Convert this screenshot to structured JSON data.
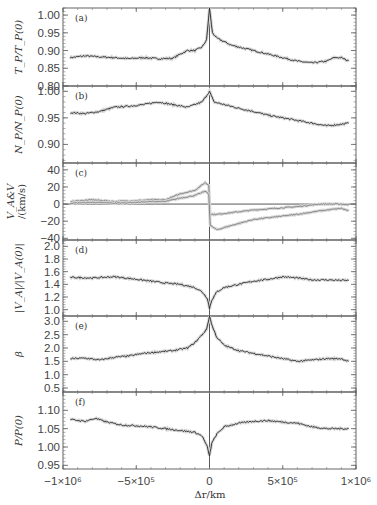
{
  "chart_data": {
    "type": "line",
    "layout": "6 vertically stacked panels sharing x-axis",
    "xlabel": "Δr/km",
    "xlim": [
      -1000000,
      1000000
    ],
    "x_ticks": [
      -1000000,
      -500000,
      0,
      500000,
      1000000
    ],
    "x_tick_labels": [
      "−1×10⁶",
      "−5×10⁵",
      "0",
      "5×10⁵",
      "1×10⁶"
    ],
    "vertical_reference_line_x": 0,
    "panels": [
      {
        "tag": "(a)",
        "ylabel": "T_P/T_P(0)",
        "ylim": [
          0.8,
          1.02
        ],
        "y_ticks": [
          0.8,
          0.85,
          0.9,
          0.95,
          1.0
        ],
        "y_tick_labels": [
          "0.80",
          "0.85",
          "0.90",
          "0.95",
          "1.00"
        ],
        "series": [
          {
            "name": "T_P/T_P(0)",
            "x": [
              -950000,
              -850000,
              -750000,
              -650000,
              -550000,
              -450000,
              -350000,
              -250000,
              -200000,
              -150000,
              -100000,
              -50000,
              -20000,
              0,
              20000,
              50000,
              100000,
              150000,
              200000,
              250000,
              300000,
              400000,
              500000,
              600000,
              700000,
              800000,
              850000,
              900000,
              950000
            ],
            "y": [
              0.88,
              0.885,
              0.882,
              0.88,
              0.877,
              0.88,
              0.877,
              0.878,
              0.89,
              0.9,
              0.9,
              0.91,
              0.93,
              1.02,
              0.95,
              0.935,
              0.925,
              0.915,
              0.91,
              0.905,
              0.9,
              0.89,
              0.88,
              0.87,
              0.865,
              0.87,
              0.88,
              0.88,
              0.87
            ]
          }
        ]
      },
      {
        "tag": "(b)",
        "ylabel": "N_P/N_P(0)",
        "ylim": [
          0.865,
          1.01
        ],
        "y_ticks": [
          0.9,
          0.95,
          1.0
        ],
        "y_tick_labels": [
          "0.90",
          "0.95",
          "1.00"
        ],
        "series": [
          {
            "name": "N_P/N_P(0)",
            "x": [
              -950000,
              -850000,
              -750000,
              -650000,
              -550000,
              -450000,
              -350000,
              -250000,
              -150000,
              -100000,
              -50000,
              0,
              30000,
              100000,
              200000,
              300000,
              400000,
              500000,
              600000,
              700000,
              800000,
              900000,
              950000
            ],
            "y": [
              0.96,
              0.958,
              0.962,
              0.97,
              0.972,
              0.975,
              0.98,
              0.975,
              0.97,
              0.975,
              0.98,
              1.0,
              0.98,
              0.975,
              0.968,
              0.962,
              0.955,
              0.95,
              0.945,
              0.94,
              0.935,
              0.938,
              0.94
            ]
          }
        ]
      },
      {
        "tag": "(c)",
        "ylabel": "V_A&V",
        "ylabel2": "/(km/s)",
        "ylim": [
          -42,
          48
        ],
        "y_ticks": [
          -40,
          -20,
          0,
          20,
          40
        ],
        "y_tick_labels": [
          "−40",
          "−20",
          "0",
          "20",
          "40"
        ],
        "horizontal_reference_line_y": 0,
        "series": [
          {
            "name": "V_A (upper gray)",
            "x": [
              -950000,
              -800000,
              -650000,
              -500000,
              -400000,
              -300000,
              -200000,
              -100000,
              -30000,
              -5000,
              5000,
              50000,
              150000,
              300000,
              450000,
              600000,
              750000,
              900000,
              950000
            ],
            "y": [
              3,
              5,
              3,
              4,
              5,
              5,
              12,
              16,
              25,
              22,
              -12,
              -12,
              -10,
              -7,
              -5,
              -3,
              0,
              0,
              -1
            ]
          },
          {
            "name": "V (lower gray)",
            "x": [
              -950000,
              -800000,
              -650000,
              -500000,
              -400000,
              -300000,
              -200000,
              -100000,
              -30000,
              -5000,
              5000,
              50000,
              150000,
              300000,
              450000,
              600000,
              750000,
              900000,
              950000
            ],
            "y": [
              1,
              2,
              1,
              2,
              3,
              3,
              7,
              10,
              15,
              12,
              -25,
              -30,
              -25,
              -18,
              -15,
              -12,
              -8,
              -5,
              -8
            ]
          }
        ]
      },
      {
        "tag": "(d)",
        "ylabel": "|V_A|/|V_A(0)|",
        "ylim": [
          0.9,
          2.1
        ],
        "y_ticks": [
          1.0,
          1.2,
          1.4,
          1.6,
          1.8,
          2.0
        ],
        "y_tick_labels": [
          "1.0",
          "1.2",
          "1.4",
          "1.6",
          "1.8",
          "2.0"
        ],
        "series": [
          {
            "name": "|V_A|/|V_A(0)|",
            "x": [
              -950000,
              -800000,
              -650000,
              -500000,
              -400000,
              -300000,
              -200000,
              -100000,
              -50000,
              -15000,
              0,
              15000,
              50000,
              100000,
              200000,
              300000,
              400000,
              500000,
              600000,
              700000,
              800000,
              950000
            ],
            "y": [
              1.51,
              1.5,
              1.52,
              1.48,
              1.45,
              1.42,
              1.4,
              1.35,
              1.28,
              1.18,
              1.02,
              1.15,
              1.28,
              1.35,
              1.4,
              1.45,
              1.48,
              1.52,
              1.5,
              1.47,
              1.47,
              1.46
            ]
          }
        ]
      },
      {
        "tag": "(e)",
        "ylabel": "β",
        "ylim": [
          0.35,
          3.2
        ],
        "y_ticks": [
          0.5,
          1.0,
          1.5,
          2.0,
          2.5,
          3.0
        ],
        "y_tick_labels": [
          "0.5",
          "1.0",
          "1.5",
          "2.0",
          "2.5",
          "3.0"
        ],
        "series": [
          {
            "name": "β",
            "x": [
              -950000,
              -850000,
              -750000,
              -650000,
              -550000,
              -450000,
              -350000,
              -250000,
              -150000,
              -100000,
              -50000,
              -20000,
              0,
              20000,
              50000,
              100000,
              200000,
              300000,
              400000,
              500000,
              600000,
              700000,
              800000,
              900000,
              950000
            ],
            "y": [
              1.6,
              1.62,
              1.55,
              1.65,
              1.7,
              1.8,
              1.85,
              1.9,
              2.0,
              2.2,
              2.5,
              2.7,
              3.2,
              2.8,
              2.4,
              2.1,
              1.9,
              1.8,
              1.7,
              1.6,
              1.5,
              1.55,
              1.6,
              1.6,
              1.5
            ]
          }
        ]
      },
      {
        "tag": "(f)",
        "ylabel": "P/P(0)",
        "ylim": [
          0.94,
          1.15
        ],
        "y_ticks": [
          0.95,
          1.0,
          1.05,
          1.1
        ],
        "y_tick_labels": [
          "0.95",
          "1.00",
          "1.05",
          "1.10"
        ],
        "series": [
          {
            "name": "P/P(0)",
            "x": [
              -950000,
              -850000,
              -780000,
              -700000,
              -600000,
              -500000,
              -400000,
              -300000,
              -200000,
              -100000,
              -50000,
              -15000,
              0,
              15000,
              50000,
              100000,
              200000,
              300000,
              400000,
              500000,
              600000,
              700000,
              800000,
              900000,
              950000
            ],
            "y": [
              1.075,
              1.07,
              1.078,
              1.068,
              1.06,
              1.058,
              1.055,
              1.05,
              1.045,
              1.04,
              1.03,
              1.0,
              0.975,
              1.01,
              1.035,
              1.055,
              1.065,
              1.07,
              1.072,
              1.068,
              1.065,
              1.055,
              1.05,
              1.05,
              1.05
            ]
          }
        ]
      }
    ]
  }
}
